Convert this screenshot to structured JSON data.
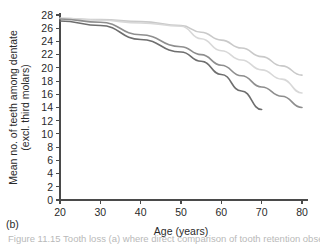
{
  "panel": {
    "label": "(b)"
  },
  "caption": {
    "text": "Figure 11.15  Tooth loss (a) where direct comparison of tooth retention observed in"
  },
  "chart_data": {
    "type": "line",
    "title": "",
    "xlabel": "Age (years)",
    "ylabel": "Mean no. of teeth among dentate\n(excl. third molars)",
    "ylabel_line1": "Mean no. of teeth among dentate",
    "ylabel_line2": "(excl. third molars)",
    "xlim": [
      20,
      80
    ],
    "ylim": [
      0,
      28
    ],
    "xticks": [
      20,
      30,
      40,
      50,
      60,
      70,
      80
    ],
    "yticks": [
      0,
      2,
      4,
      6,
      8,
      10,
      12,
      14,
      16,
      18,
      20,
      22,
      24,
      26,
      28
    ],
    "grid": false,
    "legend": "none",
    "series": [
      {
        "name": "series-lightest",
        "color": "#c9c9c9",
        "x": [
          20,
          30,
          40,
          50,
          55,
          60,
          65,
          70,
          75,
          80
        ],
        "values": [
          27.5,
          27.3,
          27.0,
          26.4,
          25.4,
          24.2,
          23.0,
          21.7,
          20.3,
          18.9
        ]
      },
      {
        "name": "series-light",
        "color": "#d8d8d8",
        "x": [
          20,
          30,
          40,
          50,
          55,
          60,
          65,
          70,
          75,
          80
        ],
        "values": [
          27.5,
          27.2,
          26.8,
          26.3,
          24.4,
          22.6,
          21.2,
          19.7,
          18.3,
          16.2
        ]
      },
      {
        "name": "series-medium",
        "color": "#8e8e8e",
        "x": [
          20,
          30,
          40,
          50,
          55,
          60,
          65,
          70,
          75,
          80
        ],
        "values": [
          27.4,
          26.9,
          25.0,
          23.2,
          22.0,
          20.4,
          18.8,
          17.1,
          15.7,
          14.0
        ]
      },
      {
        "name": "series-dark",
        "color": "#6e6e6e",
        "x": [
          20,
          30,
          40,
          50,
          55,
          60,
          65,
          70
        ],
        "values": [
          27.1,
          26.4,
          24.3,
          22.4,
          21.0,
          19.0,
          16.5,
          13.7
        ]
      }
    ]
  }
}
